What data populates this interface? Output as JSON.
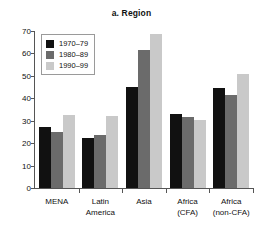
{
  "chart_data": {
    "type": "bar",
    "title": "a. Region",
    "xlabel": "",
    "ylabel": "",
    "ylim": [
      0,
      70
    ],
    "yticks": [
      0,
      10,
      20,
      30,
      40,
      50,
      60,
      70
    ],
    "grid": false,
    "legend_position": "top-left",
    "categories": [
      "MENA",
      "Latin America",
      "Asia",
      "Africa (CFA)",
      "Africa (non-CFA)"
    ],
    "category_lines": [
      [
        "MENA"
      ],
      [
        "Latin",
        "America"
      ],
      [
        "Asia"
      ],
      [
        "Africa",
        "(CFA)"
      ],
      [
        "Africa",
        "(non-CFA)"
      ]
    ],
    "series": [
      {
        "name": "1970–79",
        "color": "#111111",
        "values": [
          27,
          22.5,
          45,
          33,
          44.5
        ]
      },
      {
        "name": "1980–89",
        "color": "#6b6b6b",
        "values": [
          25,
          23.5,
          61.5,
          31.8,
          41.5
        ]
      },
      {
        "name": "1990–99",
        "color": "#c9c9c9",
        "values": [
          32.5,
          32,
          68.5,
          30.5,
          51
        ]
      }
    ]
  },
  "axis": {
    "y_tick_labels": [
      "0",
      "10",
      "20",
      "30",
      "40",
      "50",
      "60",
      "70"
    ]
  },
  "legend": {
    "entries": [
      {
        "label": "1970–79"
      },
      {
        "label": "1980–89"
      },
      {
        "label": "1990–99"
      }
    ]
  }
}
